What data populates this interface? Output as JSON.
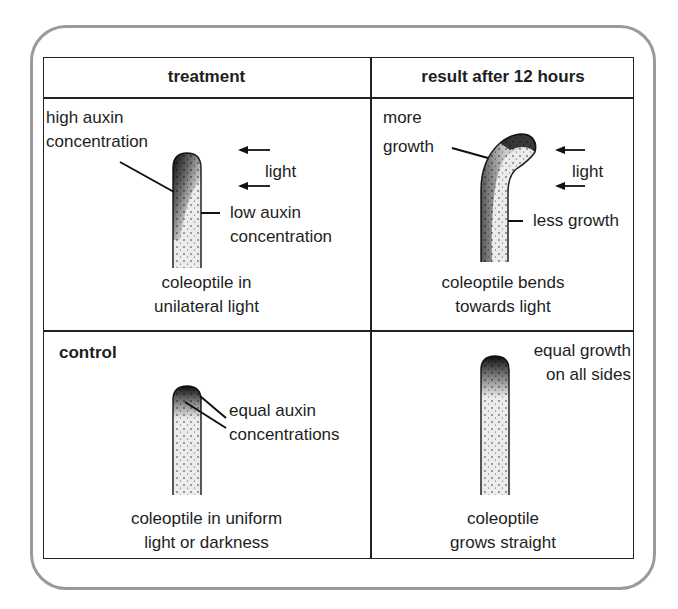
{
  "headers": {
    "treatment": "treatment",
    "result": "result after 12 hours"
  },
  "panels": {
    "treatment_unilateral": {
      "label_high": [
        "high auxin",
        "concentration"
      ],
      "label_light": "light",
      "label_low": [
        "low auxin",
        "concentration"
      ],
      "caption": [
        "coleoptile in",
        "unilateral light"
      ]
    },
    "result_unilateral": {
      "label_more": [
        "more",
        "growth"
      ],
      "label_light": "light",
      "label_less": "less growth",
      "caption": [
        "coleoptile bends",
        "towards light"
      ]
    },
    "treatment_control": {
      "title": "control",
      "label_equal": [
        "equal auxin",
        "concentrations"
      ],
      "caption": [
        "coleoptile in uniform",
        "light or darkness"
      ]
    },
    "result_control": {
      "label_equal": [
        "equal growth",
        "on all sides"
      ],
      "caption": [
        "coleoptile",
        "grows straight"
      ]
    }
  },
  "colors": {
    "frame": "#9a9a9a",
    "lines": "#222222",
    "stipple": "#1a1a1a",
    "coleoptile_fill": "#ececec"
  }
}
